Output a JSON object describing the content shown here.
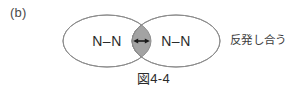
{
  "figure": {
    "panel_label": "(b)",
    "caption": "図4-4",
    "side_note": "反発し合う",
    "left_molecule": "N–N",
    "right_molecule": "N–N",
    "colors": {
      "outline": "#8c8c8c",
      "overlap_fill": "#a3a3a3",
      "overlap_outline": "#7d7d7d",
      "arrow": "#1a1a1a",
      "text": "#2b2b2b",
      "label_text": "#4a4a4a",
      "background": "#ffffff"
    },
    "geometry": {
      "left_ellipse_cx": 107,
      "left_ellipse_cy": 41,
      "right_ellipse_cx": 176,
      "right_ellipse_cy": 41,
      "ellipse_rx": 44,
      "ellipse_ry": 26,
      "arrow_y": 41,
      "arrow_x1": 134,
      "arrow_x2": 149
    }
  }
}
